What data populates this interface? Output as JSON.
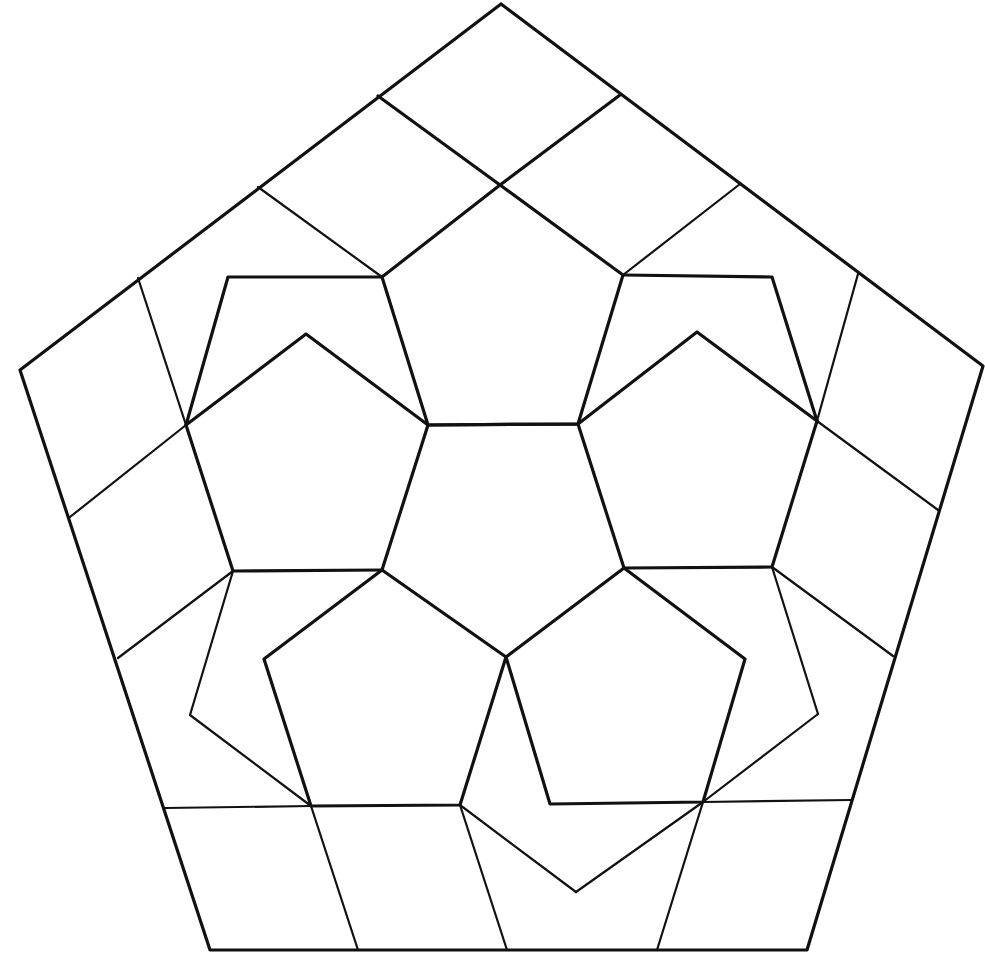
{
  "diagram": {
    "title": "",
    "stroke_color": "#111111",
    "background": "#ffffff",
    "width": 985,
    "height": 975,
    "outer_pentagon": [
      [
        501,
        4
      ],
      [
        983,
        366
      ],
      [
        807,
        950
      ],
      [
        210,
        950
      ],
      [
        20,
        370
      ]
    ],
    "thick_lines": [
      [
        [
          501,
          4
        ],
        [
          983,
          366
        ],
        [
          807,
          950
        ],
        [
          210,
          950
        ],
        [
          20,
          370
        ],
        [
          501,
          4
        ]
      ],
      [
        [
          428,
          425
        ],
        [
          578,
          424
        ],
        [
          624,
          568
        ],
        [
          506,
          657
        ],
        [
          382,
          570
        ],
        [
          428,
          425
        ]
      ],
      [
        [
          500,
          185
        ],
        [
          623,
          275
        ],
        [
          578,
          424
        ],
        [
          428,
          425
        ],
        [
          382,
          277
        ],
        [
          500,
          185
        ]
      ],
      [
        [
          382,
          277
        ],
        [
          228,
          277
        ],
        [
          186,
          425
        ],
        [
          306,
          334
        ],
        [
          428,
          425
        ]
      ],
      [
        [
          186,
          425
        ],
        [
          233,
          571
        ],
        [
          382,
          570
        ]
      ],
      [
        [
          623,
          275
        ],
        [
          772,
          277
        ],
        [
          817,
          421
        ],
        [
          697,
          332
        ],
        [
          578,
          424
        ]
      ],
      [
        [
          817,
          421
        ],
        [
          772,
          567
        ],
        [
          624,
          568
        ]
      ],
      [
        [
          382,
          570
        ],
        [
          264,
          659
        ],
        [
          311,
          806
        ],
        [
          460,
          805
        ],
        [
          506,
          657
        ]
      ],
      [
        [
          506,
          657
        ],
        [
          550,
          804
        ],
        [
          703,
          802
        ],
        [
          745,
          659
        ],
        [
          624,
          568
        ]
      ],
      [
        [
          378,
          96
        ],
        [
          500,
          185
        ],
        [
          620,
          95
        ]
      ]
    ],
    "thin_lines": [
      [
        [
          258,
          187
        ],
        [
          382,
          277
        ]
      ],
      [
        [
          740,
          184
        ],
        [
          623,
          275
        ]
      ],
      [
        [
          138,
          278
        ],
        [
          186,
          425
        ]
      ],
      [
        [
          70,
          517
        ],
        [
          186,
          425
        ]
      ],
      [
        [
          118,
          658
        ],
        [
          233,
          571
        ]
      ],
      [
        [
          233,
          571
        ],
        [
          190,
          715
        ]
      ],
      [
        [
          190,
          715
        ],
        [
          311,
          806
        ]
      ],
      [
        [
          165,
          808
        ],
        [
          311,
          806
        ]
      ],
      [
        [
          311,
          806
        ],
        [
          358,
          950
        ]
      ],
      [
        [
          858,
          274
        ],
        [
          817,
          421
        ]
      ],
      [
        [
          938,
          510
        ],
        [
          817,
          421
        ]
      ],
      [
        [
          893,
          656
        ],
        [
          772,
          567
        ]
      ],
      [
        [
          772,
          567
        ],
        [
          818,
          714
        ]
      ],
      [
        [
          818,
          714
        ],
        [
          703,
          802
        ]
      ],
      [
        [
          851,
          800
        ],
        [
          703,
          802
        ]
      ],
      [
        [
          703,
          802
        ],
        [
          657,
          950
        ]
      ],
      [
        [
          460,
          805
        ],
        [
          507,
          950
        ]
      ],
      [
        [
          460,
          805
        ],
        [
          576,
          892
        ]
      ],
      [
        [
          576,
          892
        ],
        [
          703,
          802
        ]
      ]
    ]
  }
}
